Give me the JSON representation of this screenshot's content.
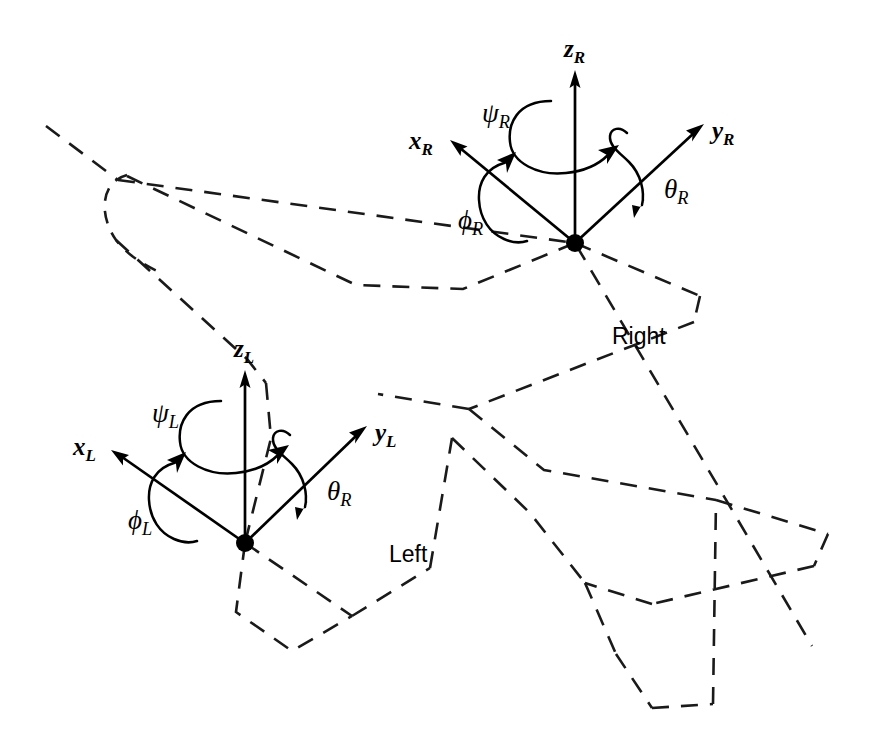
{
  "figure": {
    "type": "technical-diagram",
    "background_color": "#ffffff",
    "line_color": "#1a1a1a",
    "axis_color": "#000000",
    "outline_style": "dashed",
    "width": 869,
    "height": 740
  },
  "side_labels": {
    "right": "Right",
    "left": "Left"
  },
  "frames": [
    {
      "id": "right",
      "name": "right-wing-frame",
      "origin": {
        "x": 575,
        "y": 243
      },
      "axes": [
        {
          "id": "z",
          "label": "z",
          "subscript": "R",
          "tip": {
            "x": 575,
            "y": 75
          },
          "label_pos": {
            "x": 564,
            "y": 36
          }
        },
        {
          "id": "x",
          "label": "x",
          "subscript": "R",
          "tip": {
            "x": 452,
            "y": 143
          },
          "label_pos": {
            "x": 409,
            "y": 128
          }
        },
        {
          "id": "y",
          "label": "y",
          "subscript": "R",
          "tip": {
            "x": 702,
            "y": 126
          },
          "label_pos": {
            "x": 712,
            "y": 118
          }
        }
      ],
      "rotations": [
        {
          "id": "yaw",
          "label": "ψ",
          "subscript": "R",
          "about": "z",
          "label_pos": {
            "x": 482,
            "y": 100
          }
        },
        {
          "id": "roll",
          "label": "ϕ",
          "subscript": "R",
          "about": "x",
          "label_pos": {
            "x": 458,
            "y": 207
          }
        },
        {
          "id": "pitch",
          "label": "θ",
          "subscript": "R",
          "about": "y",
          "label_pos": {
            "x": 664,
            "y": 176
          }
        }
      ]
    },
    {
      "id": "left",
      "name": "left-wing-frame",
      "origin": {
        "x": 245,
        "y": 543
      },
      "axes": [
        {
          "id": "z",
          "label": "z",
          "subscript": "L",
          "tip": {
            "x": 245,
            "y": 375
          },
          "label_pos": {
            "x": 234,
            "y": 336
          }
        },
        {
          "id": "x",
          "label": "x",
          "subscript": "L",
          "tip": {
            "x": 113,
            "y": 451
          },
          "label_pos": {
            "x": 73,
            "y": 434
          }
        },
        {
          "id": "y",
          "label": "y",
          "subscript": "L",
          "tip": {
            "x": 365,
            "y": 428
          },
          "label_pos": {
            "x": 375,
            "y": 420
          }
        }
      ],
      "rotations": [
        {
          "id": "yaw",
          "label": "ψ",
          "subscript": "L",
          "about": "z",
          "label_pos": {
            "x": 152,
            "y": 400
          }
        },
        {
          "id": "roll",
          "label": "ϕ",
          "subscript": "L",
          "about": "x",
          "label_pos": {
            "x": 128,
            "y": 507
          }
        },
        {
          "id": "pitch",
          "label": "θ",
          "subscript": "R",
          "about": "y",
          "label_pos": {
            "x": 327,
            "y": 478
          }
        }
      ]
    }
  ]
}
